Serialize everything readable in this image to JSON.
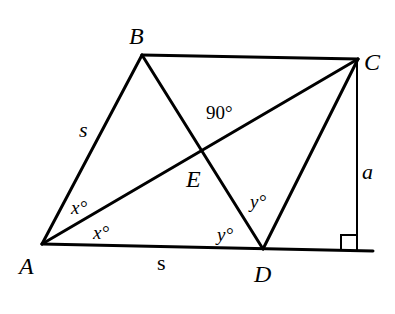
{
  "diagram": {
    "type": "geometry",
    "vertices": {
      "A": {
        "label": "A",
        "x": 42,
        "y": 244
      },
      "B": {
        "label": "B",
        "x": 142,
        "y": 55
      },
      "C": {
        "label": "C",
        "x": 358,
        "y": 59
      },
      "D": {
        "label": "D",
        "x": 263,
        "y": 249
      },
      "E": {
        "label": "E",
        "x": 202,
        "y": 151
      }
    },
    "segments": [
      {
        "from": "A",
        "to": "B"
      },
      {
        "from": "B",
        "to": "C"
      },
      {
        "from": "A",
        "to": "C"
      },
      {
        "from": "B",
        "to": "D"
      },
      {
        "from": "C",
        "to": "D"
      },
      {
        "from": "A",
        "to": "D"
      }
    ],
    "labels": {
      "side_AB": "s",
      "side_AD": "s",
      "height": "a",
      "angle_E": "90°",
      "angle_BAE": "x°",
      "angle_EAD": "x°",
      "angle_EDC": "y°",
      "angle_ADE": "y°"
    },
    "right_angle_marker": true,
    "stroke_color": "#000000",
    "background": "#ffffff"
  }
}
